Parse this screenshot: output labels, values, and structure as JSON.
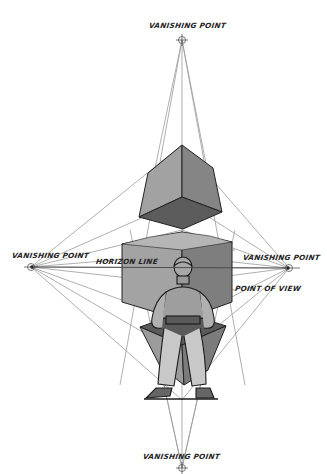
{
  "diagram": {
    "labels": {
      "vp_top": "VANISHING POINT",
      "vp_left": "VANISHING POINT",
      "vp_right": "VANISHING POINT",
      "vp_bottom": "VANISHING POINT",
      "horizon": "HORIZON LINE",
      "point_of_view": "POINT OF VIEW"
    },
    "vanishing_points": {
      "top": [
        182,
        40
      ],
      "left": [
        31,
        267
      ],
      "right": [
        289,
        268
      ],
      "bottom": [
        182,
        468
      ]
    },
    "colors": {
      "guide_line": "#9a9a9a",
      "cube_light": "#9d9d9d",
      "cube_mid": "#7b7b7b",
      "cube_dark": "#5a5a5a",
      "outline": "#222222",
      "background": "#ffffff"
    },
    "elements": [
      "top cube",
      "middle cube at horizon",
      "bottom cube",
      "standing figure"
    ]
  }
}
